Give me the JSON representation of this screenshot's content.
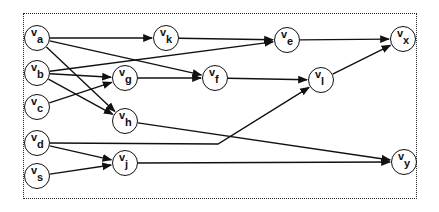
{
  "diagram": {
    "type": "directed-graph",
    "frame_style": "dotted",
    "colors": {
      "stroke": "#111111",
      "background": "#ffffff"
    },
    "nodes": [
      {
        "id": "a",
        "base": "v",
        "sub": "a",
        "x": 37,
        "y": 38
      },
      {
        "id": "b",
        "base": "v",
        "sub": "b",
        "x": 37,
        "y": 73
      },
      {
        "id": "c",
        "base": "v",
        "sub": "c",
        "x": 37,
        "y": 107
      },
      {
        "id": "d",
        "base": "v",
        "sub": "d",
        "x": 37,
        "y": 143
      },
      {
        "id": "s",
        "base": "v",
        "sub": "s",
        "x": 37,
        "y": 176
      },
      {
        "id": "k",
        "base": "v",
        "sub": "k",
        "x": 166,
        "y": 38
      },
      {
        "id": "g",
        "base": "v",
        "sub": "g",
        "x": 125,
        "y": 78
      },
      {
        "id": "h",
        "base": "v",
        "sub": "h",
        "x": 125,
        "y": 121
      },
      {
        "id": "j",
        "base": "v",
        "sub": "j",
        "x": 125,
        "y": 163
      },
      {
        "id": "f",
        "base": "v",
        "sub": "f",
        "x": 215,
        "y": 78
      },
      {
        "id": "e",
        "base": "v",
        "sub": "e",
        "x": 287,
        "y": 40
      },
      {
        "id": "l",
        "base": "v",
        "sub": "l",
        "x": 321,
        "y": 80
      },
      {
        "id": "x",
        "base": "v",
        "sub": "x",
        "x": 403,
        "y": 39
      },
      {
        "id": "y",
        "base": "v",
        "sub": "y",
        "x": 404,
        "y": 162
      }
    ],
    "edges": [
      {
        "from": "a",
        "to": "k"
      },
      {
        "from": "a",
        "to": "f"
      },
      {
        "from": "a",
        "to": "h"
      },
      {
        "from": "b",
        "to": "e"
      },
      {
        "from": "b",
        "to": "g"
      },
      {
        "from": "b",
        "to": "h"
      },
      {
        "from": "c",
        "to": "g"
      },
      {
        "from": "d",
        "to": "l",
        "via": [
          [
            218,
            144
          ]
        ]
      },
      {
        "from": "d",
        "to": "j"
      },
      {
        "from": "s",
        "to": "j"
      },
      {
        "from": "k",
        "to": "e"
      },
      {
        "from": "g",
        "to": "f"
      },
      {
        "from": "f",
        "to": "l"
      },
      {
        "from": "e",
        "to": "x"
      },
      {
        "from": "l",
        "to": "x"
      },
      {
        "from": "h",
        "to": "y"
      },
      {
        "from": "j",
        "to": "y"
      }
    ]
  }
}
